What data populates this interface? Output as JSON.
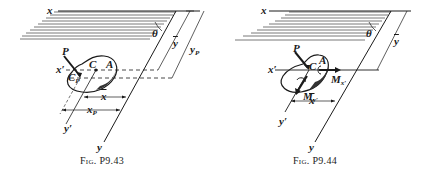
{
  "figures": [
    {
      "id": "left",
      "caption": "Fig. P9.43",
      "labels": {
        "x_axis": "x",
        "y_axis": "y",
        "x_prime": "x′",
        "y_prime": "y′",
        "theta": "θ",
        "force": "P",
        "centroid": "C",
        "area": "A",
        "center_of_pressure": "C",
        "center_of_pressure_sub": "P",
        "y_bar": "y",
        "y_p": "y",
        "y_p_sub": "P",
        "x_bar": "x",
        "x_p": "x",
        "x_p_sub": "P"
      }
    },
    {
      "id": "right",
      "caption": "Fig. P9.44",
      "labels": {
        "x_axis": "x",
        "y_axis": "y",
        "x_prime": "x′",
        "y_prime": "y′",
        "theta": "θ",
        "force": "P",
        "centroid": "C",
        "area": "A",
        "y_bar": "y",
        "x_bar": "x",
        "moment_x": "M",
        "moment_x_sub": "x′",
        "moment_y": "M",
        "moment_y_sub": "y′"
      }
    }
  ],
  "colors": {
    "ink": "#1a1a1a",
    "paper": "#ffffff",
    "hatch": "#555555"
  }
}
